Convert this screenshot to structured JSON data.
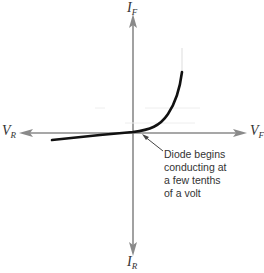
{
  "diagram": {
    "axes": {
      "y_positive": {
        "label": "I",
        "subscript": "F"
      },
      "y_negative": {
        "label": "I",
        "subscript": "R"
      },
      "x_negative": {
        "label": "V",
        "subscript": "R"
      },
      "x_positive": {
        "label": "V",
        "subscript": "F"
      }
    },
    "annotation": {
      "lines": [
        "Diode begins",
        "conducting at",
        "a few tenths",
        "of a volt"
      ]
    },
    "colors": {
      "axis": "#8a8a8a",
      "curve": "#111111",
      "text": "#333333"
    }
  }
}
